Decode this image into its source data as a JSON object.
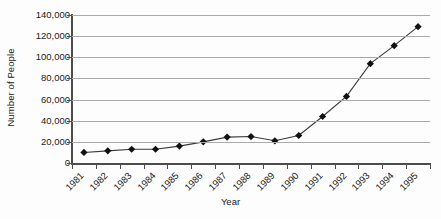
{
  "chart_data": {
    "type": "line",
    "title": "",
    "xlabel": "Year",
    "ylabel": "Number of People",
    "categories": [
      "1981",
      "1982",
      "1983",
      "1984",
      "1985",
      "1986",
      "1987",
      "1988",
      "1989",
      "1990",
      "1991",
      "1992",
      "1993",
      "1994",
      "1995"
    ],
    "values": [
      10000,
      11500,
      13000,
      13000,
      16000,
      20000,
      24500,
      25000,
      21000,
      26000,
      44000,
      63000,
      94000,
      111000,
      129000
    ],
    "series": [
      {
        "name": "Number of People",
        "values": [
          10000,
          11500,
          13000,
          13000,
          16000,
          20000,
          24500,
          25000,
          21000,
          26000,
          44000,
          63000,
          94000,
          111000,
          129000
        ]
      }
    ],
    "ylim": [
      0,
      140000
    ],
    "ytick_values": [
      0,
      20000,
      40000,
      60000,
      80000,
      100000,
      120000,
      140000
    ],
    "ytick_labels": [
      "0",
      "20,000",
      "40,000",
      "60,000",
      "80,000",
      "100,000",
      "120,000",
      "140,000"
    ],
    "grid": "horizontal",
    "legend": "none",
    "marker": "diamond",
    "line_color": "#3a3a3a",
    "marker_color": "#111111",
    "grid_color": "#aaaaaa",
    "axis_color": "#4d4d4d",
    "background_color": "#fdfdfd",
    "xtick_rotation": -45
  }
}
